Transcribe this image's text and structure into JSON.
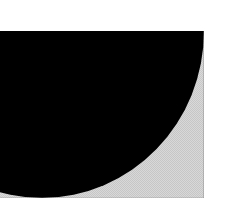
{
  "document": {
    "title": "Abstract Quarter-Disc Graphic",
    "background_color": "#ffffff",
    "width": 229,
    "height": 222
  },
  "graphic": {
    "name": "quarter-disc-figure",
    "description": "Black quarter-ellipse on a light gray halftone-dithered rectangular panel",
    "panel": {
      "label": "halftone-panel",
      "fill_color": "#d8d8d8",
      "texture": "checkerboard-dither",
      "x": 0,
      "y": 31,
      "width": 204,
      "height": 167
    },
    "shape": {
      "label": "quarter-ellipse",
      "fill_color": "#000000",
      "anchor_corner": "bottom-right",
      "top_edge_crossing_x": 158,
      "bottom_edge_crossing_x": 42,
      "radius_x": 162,
      "radius_y": 167
    }
  },
  "caption": ""
}
